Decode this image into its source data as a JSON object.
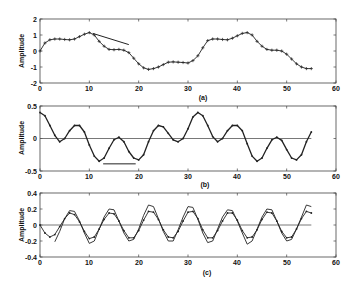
{
  "chart_data": [
    {
      "type": "line",
      "panel_label": "(a)",
      "title": "",
      "xlabel": "",
      "ylabel": "Amplitude",
      "xlim": [
        0,
        60
      ],
      "ylim": [
        -2,
        2
      ],
      "xticks": [
        0,
        10,
        20,
        30,
        40,
        50,
        60
      ],
      "yticks": [
        -2,
        -1,
        0,
        1,
        2
      ],
      "grid": false,
      "zero_line": false,
      "series": [
        {
          "name": "signal",
          "marker": "+",
          "x": [
            0,
            1,
            2,
            3,
            4,
            5,
            6,
            7,
            8,
            9,
            10,
            11,
            12,
            13,
            14,
            15,
            16,
            17,
            18,
            19,
            20,
            21,
            22,
            23,
            24,
            25,
            26,
            27,
            28,
            29,
            30,
            31,
            32,
            33,
            34,
            35,
            36,
            37,
            38,
            39,
            40,
            41,
            42,
            43,
            44,
            45,
            46,
            47,
            48,
            49,
            50,
            51,
            52,
            53,
            54,
            55
          ],
          "values": [
            0,
            0.5,
            0.7,
            0.75,
            0.75,
            0.72,
            0.7,
            0.75,
            0.9,
            1.05,
            1.15,
            1.0,
            0.6,
            0.3,
            0.1,
            0.08,
            0.1,
            0.05,
            -0.1,
            -0.45,
            -0.8,
            -1.05,
            -1.15,
            -1.1,
            -1.0,
            -0.85,
            -0.7,
            -0.68,
            -0.7,
            -0.72,
            -0.75,
            -0.6,
            -0.3,
            0.2,
            0.65,
            0.75,
            0.75,
            0.72,
            0.7,
            0.8,
            0.95,
            1.1,
            1.15,
            1.0,
            0.6,
            0.3,
            0.1,
            0.05,
            0.05,
            0.0,
            -0.2,
            -0.5,
            -0.8,
            -1.0,
            -1.1,
            -1.1
          ]
        }
      ],
      "annotations": [
        {
          "type": "line",
          "x": [
            10.7,
            18.0
          ],
          "y": [
            1.1,
            0.4
          ]
        }
      ]
    },
    {
      "type": "line",
      "panel_label": "(b)",
      "title": "",
      "xlabel": "",
      "ylabel": "Amplitude",
      "xlim": [
        0,
        60
      ],
      "ylim": [
        -0.5,
        0.5
      ],
      "xticks": [
        0,
        10,
        20,
        30,
        40,
        50,
        60
      ],
      "yticks": [
        -0.5,
        0,
        0.5
      ],
      "grid": false,
      "zero_line": true,
      "series": [
        {
          "name": "component",
          "marker": ".",
          "x": [
            0,
            1,
            2,
            3,
            4,
            5,
            6,
            7,
            8,
            9,
            10,
            11,
            12,
            13,
            14,
            15,
            16,
            17,
            18,
            19,
            20,
            21,
            22,
            23,
            24,
            25,
            26,
            27,
            28,
            29,
            30,
            31,
            32,
            33,
            34,
            35,
            36,
            37,
            38,
            39,
            40,
            41,
            42,
            43,
            44,
            45,
            46,
            47,
            48,
            49,
            50,
            51,
            52,
            53,
            54,
            55
          ],
          "values": [
            0.4,
            0.35,
            0.2,
            0.05,
            -0.05,
            0.0,
            0.12,
            0.2,
            0.2,
            0.1,
            -0.1,
            -0.27,
            -0.35,
            -0.3,
            -0.15,
            -0.02,
            0.02,
            -0.05,
            -0.2,
            -0.3,
            -0.33,
            -0.25,
            -0.05,
            0.12,
            0.2,
            0.18,
            0.08,
            -0.02,
            -0.05,
            0.0,
            0.15,
            0.33,
            0.4,
            0.35,
            0.2,
            0.03,
            -0.05,
            0.0,
            0.12,
            0.2,
            0.2,
            0.12,
            -0.08,
            -0.27,
            -0.35,
            -0.3,
            -0.15,
            -0.02,
            0.02,
            -0.03,
            -0.17,
            -0.3,
            -0.33,
            -0.25,
            -0.05,
            0.1
          ]
        }
      ],
      "annotations": [
        {
          "type": "line",
          "x": [
            12.8,
            19.4
          ],
          "y": [
            -0.39,
            -0.39
          ]
        }
      ]
    },
    {
      "type": "line",
      "panel_label": "(c)",
      "title": "",
      "xlabel": "",
      "ylabel": "Amplitude",
      "xlim": [
        0,
        60
      ],
      "ylim": [
        -0.4,
        0.4
      ],
      "xticks": [
        0,
        10,
        20,
        30,
        40,
        50,
        60
      ],
      "yticks": [
        -0.4,
        -0.2,
        0,
        0.2,
        0.4
      ],
      "grid": false,
      "zero_line": true,
      "series": [
        {
          "name": "series-1",
          "marker": ".",
          "x": [
            0,
            1,
            2,
            3,
            4,
            5,
            6,
            7,
            8,
            9,
            10,
            11,
            12,
            13,
            14,
            15,
            16,
            17,
            18,
            19,
            20,
            21,
            22,
            23,
            24,
            25,
            26,
            27,
            28,
            29,
            30,
            31,
            32,
            33,
            34,
            35,
            36,
            37,
            38,
            39,
            40,
            41,
            42,
            43,
            44,
            45,
            46,
            47,
            48,
            49,
            50,
            51,
            52,
            53,
            54,
            55
          ],
          "values": [
            0,
            -0.1,
            -0.15,
            -0.12,
            -0.02,
            0.08,
            0.15,
            0.13,
            0.04,
            -0.08,
            -0.17,
            -0.15,
            -0.05,
            0.07,
            0.15,
            0.14,
            0.05,
            -0.07,
            -0.16,
            -0.16,
            -0.07,
            0.06,
            0.17,
            0.16,
            0.07,
            -0.06,
            -0.15,
            -0.16,
            -0.08,
            0.05,
            0.16,
            0.17,
            0.08,
            -0.06,
            -0.16,
            -0.16,
            -0.07,
            0.05,
            0.15,
            0.15,
            0.06,
            -0.07,
            -0.16,
            -0.15,
            -0.06,
            0.07,
            0.16,
            0.15,
            0.05,
            -0.08,
            -0.16,
            -0.15,
            -0.05,
            0.08,
            0.17,
            0.15
          ]
        },
        {
          "name": "series-2",
          "marker": "none",
          "x": [
            3,
            4,
            5,
            6,
            7,
            8,
            9,
            10,
            11,
            12,
            13,
            14,
            15,
            16,
            17,
            18,
            19,
            20,
            21,
            22,
            23,
            24,
            25,
            26,
            27,
            28,
            29,
            30,
            31,
            32,
            33,
            34,
            35,
            36,
            37,
            38,
            39,
            40,
            41,
            42,
            43,
            44,
            45,
            46,
            47,
            48,
            49,
            50,
            51,
            52,
            53,
            54,
            55
          ],
          "values": [
            -0.21,
            -0.08,
            0.08,
            0.18,
            0.17,
            0.05,
            -0.1,
            -0.23,
            -0.2,
            -0.05,
            0.1,
            0.2,
            0.19,
            0.05,
            -0.1,
            -0.2,
            -0.18,
            -0.05,
            0.12,
            0.25,
            0.23,
            0.08,
            -0.08,
            -0.2,
            -0.2,
            -0.06,
            0.1,
            0.23,
            0.22,
            0.07,
            -0.1,
            -0.22,
            -0.2,
            -0.05,
            0.1,
            0.19,
            0.18,
            0.05,
            -0.1,
            -0.24,
            -0.2,
            -0.05,
            0.1,
            0.2,
            0.19,
            0.05,
            -0.1,
            -0.2,
            -0.18,
            -0.05,
            0.1,
            0.25,
            0.23
          ]
        }
      ],
      "annotations": []
    }
  ],
  "panels": [
    {
      "label": "(a)",
      "ylabel": "Amplitude",
      "x_ticks": [
        "0",
        "10",
        "20",
        "30",
        "40",
        "50",
        "60"
      ],
      "y_ticks": [
        "2",
        "1",
        "0",
        "-1",
        "-2"
      ]
    },
    {
      "label": "(b)",
      "ylabel": "Amplitude",
      "x_ticks": [
        "0",
        "10",
        "20",
        "30",
        "40",
        "50",
        "60"
      ],
      "y_ticks": [
        "0.5",
        "0",
        "-0.5"
      ]
    },
    {
      "label": "(c)",
      "ylabel": "Amplitude",
      "x_ticks": [
        "0",
        "10",
        "20",
        "30",
        "40",
        "50",
        "60"
      ],
      "y_ticks": [
        "0.4",
        "0.2",
        "0",
        "-0.2",
        "-0.4"
      ]
    }
  ],
  "colors": {
    "line": "#222222",
    "axis": "#444444",
    "zero_line": "#555555",
    "background": "#ffffff"
  }
}
